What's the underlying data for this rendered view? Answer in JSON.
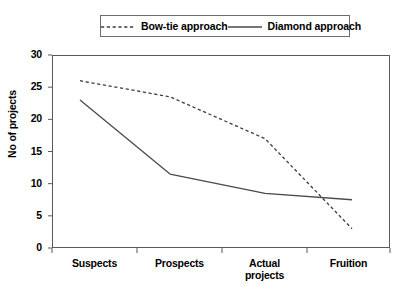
{
  "chart_data": {
    "type": "line",
    "title": "",
    "xlabel": "",
    "ylabel": "No of projects",
    "categories": [
      "Suspects",
      "Prospects",
      "Actual projects",
      "Fruition"
    ],
    "category_lines": [
      [
        "Suspects"
      ],
      [
        "Prospects"
      ],
      [
        "Actual",
        "projects"
      ],
      [
        "Fruition"
      ]
    ],
    "ylim": [
      0,
      30
    ],
    "yticks": [
      0,
      5,
      10,
      15,
      20,
      25,
      30
    ],
    "grid": false,
    "legend_position": "top",
    "series": [
      {
        "name": "Bow-tie approach",
        "style": "dashed",
        "color": "#3a3a55",
        "values": [
          26,
          23.5,
          17,
          3
        ]
      },
      {
        "name": "Diamond approach",
        "style": "solid",
        "color": "#4a4a4a",
        "values": [
          23,
          11.5,
          8.5,
          7.5
        ]
      }
    ]
  },
  "legend": {
    "items": [
      {
        "label": "Bow-tie approach",
        "style": "dashed"
      },
      {
        "label": "Diamond approach",
        "style": "solid"
      }
    ]
  },
  "axis": {
    "y_title": "No of projects",
    "y_tick_labels": [
      "30",
      "25",
      "20",
      "15",
      "10",
      "5",
      "0"
    ],
    "x_tick_labels": [
      "Suspects",
      "Prospects",
      "Actual projects",
      "Fruition"
    ]
  }
}
